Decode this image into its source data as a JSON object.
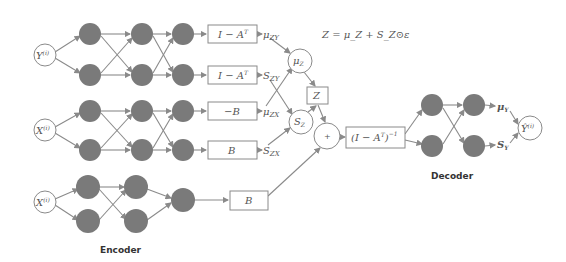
{
  "diagram": {
    "equation": "Z = μ_Z + S_Z⊙ε",
    "encoder_label": "Encoder",
    "decoder_label": "Decoder",
    "inputs": [
      {
        "id": "y_in",
        "label": "Y",
        "sup": "(i)"
      },
      {
        "id": "x_in_1",
        "label": "X",
        "sup": "(i)"
      },
      {
        "id": "x_in_2",
        "label": "X",
        "sup": "(i)"
      }
    ],
    "output": {
      "label": "Ŷ",
      "sup": "(i)"
    },
    "boxes": [
      {
        "id": "box_1",
        "label": "I − A",
        "sup": "T"
      },
      {
        "id": "box_2",
        "label": "I − A",
        "sup": "T"
      },
      {
        "id": "box_3",
        "label": "−B",
        "sup": ""
      },
      {
        "id": "box_4",
        "label": "B",
        "sup": ""
      },
      {
        "id": "box_5",
        "label": "B",
        "sup": ""
      },
      {
        "id": "box_z",
        "label": "Z",
        "sup": ""
      },
      {
        "id": "box_inv",
        "label": "(I − A",
        "sup": "T",
        "tail": ")",
        "tail_sup": "−1"
      }
    ],
    "signals": [
      {
        "label": "μ",
        "sub": "ZY"
      },
      {
        "label": "S",
        "sub": "ZY"
      },
      {
        "label": "μ",
        "sub": "ZX"
      },
      {
        "label": "S",
        "sub": "ZX"
      }
    ],
    "latent_nodes": [
      {
        "label": "μ",
        "sub": "Z"
      },
      {
        "label": "S",
        "sub": "Z"
      }
    ],
    "sum_node": {
      "label": "+"
    },
    "decoder_outputs": [
      {
        "label": "μ",
        "sub": "Y"
      },
      {
        "label": "S",
        "sub": "Y"
      }
    ]
  }
}
